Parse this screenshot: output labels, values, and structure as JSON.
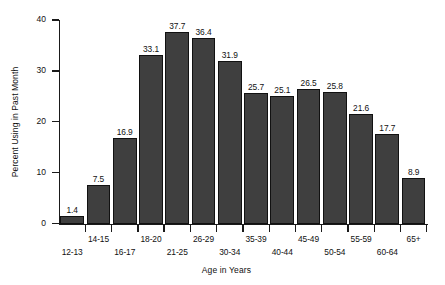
{
  "chart_data": {
    "type": "bar",
    "title": "",
    "subtitle": "",
    "xlabel": "Age in Years",
    "ylabel": "Percent Using in Past Month",
    "categories": [
      "12-13",
      "14-15",
      "16-17",
      "18-20",
      "21-25",
      "26-29",
      "30-34",
      "35-39",
      "40-44",
      "45-49",
      "50-54",
      "55-59",
      "60-64",
      "65+"
    ],
    "values": [
      1.4,
      7.5,
      16.9,
      33.1,
      37.7,
      36.4,
      31.9,
      25.7,
      25.1,
      26.5,
      25.8,
      21.6,
      17.7,
      8.9
    ],
    "value_labels": [
      "1.4",
      "7.5",
      "16.9",
      "33.1",
      "37.7",
      "36.4",
      "31.9",
      "25.7",
      "25.1",
      "26.5",
      "25.8",
      "21.6",
      "17.7",
      "8.9"
    ],
    "ylim": [
      0,
      40
    ],
    "yticks": [
      0,
      10,
      20,
      30,
      40
    ],
    "ytick_labels": [
      "0",
      "10",
      "20",
      "30",
      "40"
    ],
    "grid": false,
    "legend": null,
    "bar_color": "#3f3f3f",
    "bar_edge_color": "#111111",
    "axis_color": "#1a1a1a",
    "background_color": "#ffffff",
    "xtick_label_layout": "staggered-two-rows"
  }
}
